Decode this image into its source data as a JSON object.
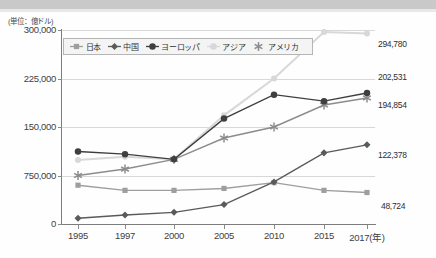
{
  "unit_label": "(単位：億ドル)",
  "axis": {
    "y_ticks": [
      "300,000",
      "225,000",
      "150,000",
      "750,000",
      "0"
    ],
    "y_values": [
      300000,
      225000,
      150000,
      75000,
      0
    ],
    "x_ticks": [
      "1995",
      "1997",
      "2000",
      "2005",
      "2010",
      "2015",
      "2017(年)"
    ]
  },
  "legend": {
    "items": [
      {
        "label": "日本",
        "marker": "square-marker",
        "color": "#9e9e9e"
      },
      {
        "label": "中国",
        "marker": "diamond-marker",
        "color": "#5a5a5a"
      },
      {
        "label": "ヨーロッパ",
        "marker": "circle-marker",
        "color": "#3f3f3f"
      },
      {
        "label": "アジア",
        "marker": "circle-light-marker",
        "color": "#d8d8d8"
      },
      {
        "label": "アメリカ",
        "marker": "asterisk-marker",
        "color": "#8c8c8c"
      }
    ]
  },
  "end_labels": [
    {
      "text": "294,780",
      "series": "アジア"
    },
    {
      "text": "202,531",
      "series": "ヨーロッパ"
    },
    {
      "text": "194,854",
      "series": "アメリカ"
    },
    {
      "text": "122,378",
      "series": "中国"
    },
    {
      "text": "48,724",
      "series": "日本"
    }
  ],
  "chart_data": {
    "type": "line",
    "title": "",
    "xlabel": "年",
    "ylabel": "億ドル",
    "ylim": [
      0,
      300000
    ],
    "grid": true,
    "legend_position": "top-left-inside",
    "categories": [
      "1995",
      "1997",
      "2000",
      "2005",
      "2010",
      "2015",
      "2017"
    ],
    "series": [
      {
        "name": "日本",
        "color": "#9e9e9e",
        "marker": "square",
        "values": [
          60000,
          52000,
          52000,
          55000,
          64000,
          52000,
          48724
        ]
      },
      {
        "name": "中国",
        "color": "#5a5a5a",
        "marker": "diamond",
        "values": [
          9000,
          14000,
          18000,
          30000,
          65000,
          110000,
          122378
        ]
      },
      {
        "name": "ヨーロッパ",
        "color": "#3f3f3f",
        "marker": "circle",
        "values": [
          112000,
          108000,
          100000,
          163000,
          200000,
          190000,
          202531
        ]
      },
      {
        "name": "アジア",
        "color": "#d8d8d8",
        "marker": "circle",
        "values": [
          99000,
          104000,
          100000,
          168000,
          225000,
          297000,
          294780
        ]
      },
      {
        "name": "アメリカ",
        "color": "#8c8c8c",
        "marker": "asterisk",
        "values": [
          75000,
          85000,
          100000,
          133000,
          150000,
          184000,
          194854
        ]
      }
    ]
  }
}
